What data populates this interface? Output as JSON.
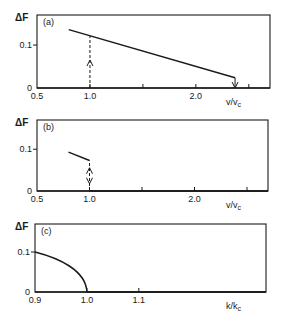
{
  "chart_data": [
    {
      "type": "line",
      "panel": "(a)",
      "ylabel": "ΔF",
      "xlabel": "v/v_c",
      "xlim": [
        0.5,
        2.7
      ],
      "ylim": [
        0,
        0.17
      ],
      "x_ticks": [
        0.5,
        1.0,
        1.5,
        2.0,
        2.5
      ],
      "x_tick_labels": [
        "0.5",
        "1.0",
        "",
        "2.0",
        ""
      ],
      "y_ticks": [
        0,
        0.1
      ],
      "y_tick_labels": [
        "0",
        "0.1"
      ],
      "series": [
        {
          "name": "ΔF",
          "style": "solid",
          "x": [
            0.8,
            2.37
          ],
          "y": [
            0.136,
            0.024
          ]
        }
      ],
      "annotations": [
        {
          "type": "dashed-arrow-up",
          "x": 1.0,
          "y_from": 0,
          "y_to": 0.121
        },
        {
          "type": "arrow-down",
          "x": 2.37,
          "y_from": 0.024,
          "y_to": 0
        }
      ]
    },
    {
      "type": "line",
      "panel": "(b)",
      "ylabel": "ΔF",
      "xlabel": "v/v_c",
      "xlim": [
        0.5,
        2.7
      ],
      "ylim": [
        0,
        0.17
      ],
      "x_ticks": [
        0.5,
        1.0,
        1.5,
        2.0,
        2.5
      ],
      "x_tick_labels": [
        "0.5",
        "1.0",
        "",
        "2.0",
        ""
      ],
      "y_ticks": [
        0,
        0.1
      ],
      "y_tick_labels": [
        "0",
        "0.1"
      ],
      "series": [
        {
          "name": "ΔF",
          "style": "solid",
          "x": [
            0.8,
            1.0
          ],
          "y": [
            0.093,
            0.073
          ]
        },
        {
          "name": "ΔF zero branch",
          "style": "solid",
          "x": [
            1.0,
            2.7
          ],
          "y": [
            0,
            0
          ]
        }
      ],
      "annotations": [
        {
          "type": "dashed-double-arrow",
          "x": 1.0,
          "y_from": 0,
          "y_to": 0.073
        }
      ]
    },
    {
      "type": "line",
      "panel": "(c)",
      "ylabel": "ΔF",
      "xlabel": "k/k_c",
      "xlim": [
        0.9,
        1.345
      ],
      "ylim": [
        0,
        0.17
      ],
      "x_ticks": [
        0.9,
        1.0,
        1.1
      ],
      "x_tick_labels": [
        "0.9",
        "1.0",
        "1.1"
      ],
      "y_ticks": [
        0,
        0.1
      ],
      "y_tick_labels": [
        "0",
        "0.1"
      ],
      "series": [
        {
          "name": "ΔF",
          "style": "solid",
          "x": [
            0.9,
            0.92,
            0.94,
            0.96,
            0.98,
            0.99,
            1.0
          ],
          "y": [
            0.1,
            0.089,
            0.077,
            0.063,
            0.045,
            0.032,
            0.0
          ]
        },
        {
          "name": "ΔF zero branch",
          "style": "solid",
          "x": [
            1.0,
            1.345
          ],
          "y": [
            0,
            0
          ]
        }
      ],
      "annotations": []
    }
  ],
  "figure": {
    "panels": [
      {
        "label": "(a)",
        "ylabel": "ΔF",
        "xlabel_main": "v/v",
        "xlabel_sub": "c"
      },
      {
        "label": "(b)",
        "ylabel": "ΔF",
        "xlabel_main": "v/v",
        "xlabel_sub": "c"
      },
      {
        "label": "(c)",
        "ylabel": "ΔF",
        "xlabel_main": "k/k",
        "xlabel_sub": "c"
      }
    ]
  }
}
